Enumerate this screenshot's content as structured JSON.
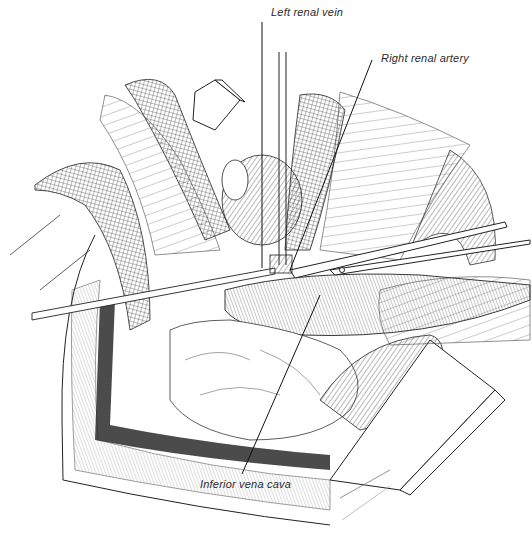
{
  "figure": {
    "type": "surgical-illustration",
    "ink_color": "#1a1a1a",
    "background_color": "#ffffff"
  },
  "labels": [
    {
      "id": "left-renal-vein",
      "text": "Left renal vein"
    },
    {
      "id": "right-renal-artery",
      "text": "Right renal artery"
    },
    {
      "id": "inferior-vena-cava",
      "text": "Inferior vena cava"
    }
  ]
}
